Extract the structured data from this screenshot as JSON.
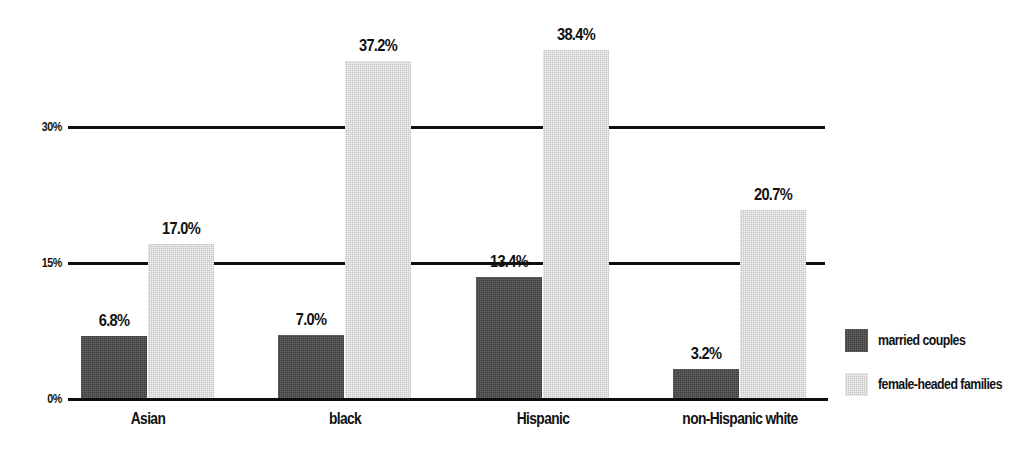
{
  "chart_data": {
    "type": "bar",
    "title": "",
    "subtitle": "",
    "xlabel": "",
    "ylabel": "",
    "categories": [
      "Asian",
      "black",
      "Hispanic",
      "non-Hispanic white"
    ],
    "series": [
      {
        "name": "married couples",
        "color": "#3d3d3d",
        "values": [
          6.8,
          7.0,
          13.4,
          3.2
        ],
        "labels": [
          "6.8%",
          "7.0%",
          "13.4%",
          "3.2%"
        ]
      },
      {
        "name": "female-headed families",
        "color": "#c6c6c6",
        "values": [
          17.0,
          37.2,
          38.4,
          20.7
        ],
        "labels": [
          "17.0%",
          "37.2%",
          "38.4%",
          "20.7%"
        ]
      }
    ],
    "ylim": [
      0,
      40
    ],
    "yticks": [
      0,
      15,
      30
    ],
    "ytick_labels": [
      "0%",
      "15%",
      "30%"
    ],
    "grid": true,
    "legend_position": "right"
  },
  "axis": {
    "ticks": [
      {
        "label": "30%",
        "value": 30
      },
      {
        "label": "15%",
        "value": 15
      },
      {
        "label": "0%",
        "value": 0
      }
    ]
  },
  "legend": {
    "items": [
      {
        "label": "married couples",
        "swatch": "dark-gray-swatch"
      },
      {
        "label": "female-headed families",
        "swatch": "light-gray-swatch"
      }
    ]
  }
}
